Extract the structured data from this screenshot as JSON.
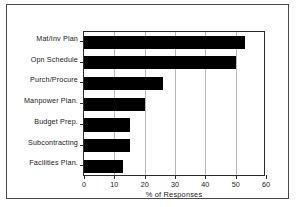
{
  "chart_data": {
    "type": "bar",
    "orientation": "horizontal",
    "title": "",
    "xlabel": "% of Responses",
    "ylabel": "",
    "categories": [
      "Mat/Inv Plan",
      "Opn Schedule",
      "Purch/Procure",
      "Manpower Plan.",
      "Budget Prep.",
      "Subcontracting",
      "Facilities Plan."
    ],
    "values": [
      53,
      50,
      26,
      20,
      15,
      15,
      13
    ],
    "xlim": [
      0,
      60
    ],
    "xticks": [
      0,
      10,
      20,
      30,
      40,
      50,
      60
    ],
    "xticklabels": [
      "0",
      "10",
      "20",
      "30",
      "40",
      "50",
      "60"
    ],
    "grid": "vertical",
    "legend": "none",
    "bar_color": "#000000",
    "background_color": "#ffffff",
    "axis_color": "#2b2b2b",
    "gridline_color": "#b9b9b9"
  }
}
